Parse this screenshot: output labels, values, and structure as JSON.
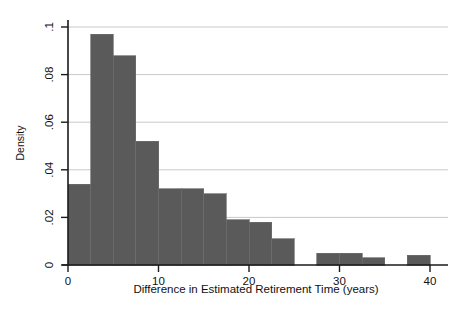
{
  "chart_data": {
    "type": "bar",
    "title": "",
    "subtitle": "",
    "xlabel": "Difference in Estimated Retirement Time (years)",
    "ylabel": "Density",
    "xlim": [
      -1.5,
      41.5
    ],
    "ylim": [
      0,
      0.1
    ],
    "xticks": [
      0,
      10,
      20,
      30,
      40
    ],
    "xtick_labels": [
      "0",
      "10",
      "20",
      "30",
      "40"
    ],
    "yticks": [
      0,
      0.02,
      0.04,
      0.06,
      0.08,
      0.1
    ],
    "ytick_labels": [
      "0",
      ".02",
      ".04",
      ".06",
      ".08",
      ".1"
    ],
    "grid": "horizontal",
    "legend": "none",
    "bar_color": "#5a5a5a",
    "bar_edge_color": "#6e6e6e",
    "bin_width": 2.5,
    "categories": [
      "0-2.5",
      "2.5-5",
      "5-7.5",
      "7.5-10",
      "10-12.5",
      "12.5-15",
      "15-17.5",
      "17.5-20",
      "20-22.5",
      "22.5-25",
      "25-27.5",
      "27.5-30",
      "30-32.5",
      "32.5-35",
      "35-37.5",
      "37.5-40"
    ],
    "bin_starts": [
      0,
      2.5,
      5,
      7.5,
      10,
      12.5,
      15,
      17.5,
      20,
      22.5,
      25,
      27.5,
      30,
      32.5,
      35,
      37.5
    ],
    "values": [
      0.034,
      0.097,
      0.088,
      0.052,
      0.032,
      0.032,
      0.03,
      0.019,
      0.018,
      0.011,
      0.0,
      0.005,
      0.005,
      0.003,
      0.0,
      0.004
    ]
  },
  "axes": {
    "x_axis_label": "Difference in Estimated Retirement Time (years)",
    "y_axis_label": "Density"
  },
  "colors": {
    "bar": "#5a5a5a",
    "grid": "#c9c9c9",
    "axis": "#1a1a1a",
    "background": "#ffffff"
  }
}
